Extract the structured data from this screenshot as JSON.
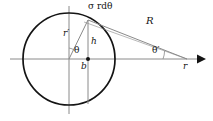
{
  "figure": {
    "background_color": "#ffffff",
    "ink_color": "#141414",
    "thin_color": "#8a8a8a",
    "width": 213,
    "height": 121,
    "labels": {
      "surface_element": "σ rdθ",
      "distance_R": "R",
      "radius_rprime": "r′",
      "height_h": "h",
      "angle_theta": "θ",
      "angle_theta_prime": "θ′",
      "base_b": "b",
      "axis_r": "r"
    },
    "geometry": {
      "circle_center_x": 69,
      "circle_center_y": 59,
      "circle_radius": 46,
      "axis_start_x": 10,
      "axis_end_x": 205,
      "axis_y": 59,
      "vertical_axis_x": 69,
      "vertical_axis_top": 6,
      "vertical_axis_bottom": 114,
      "surface_point_x": 88,
      "surface_point_y": 20,
      "foot_point_x": 88,
      "foot_point_y": 59,
      "drop_line_bottom_y": 104,
      "field_point_x": 186,
      "field_point_y": 59
    }
  }
}
